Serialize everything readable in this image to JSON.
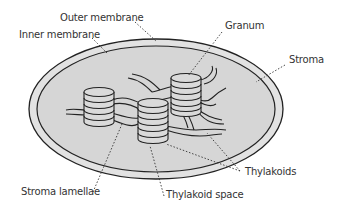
{
  "labels": {
    "outer_membrane": "Outer membrane",
    "inner_membrane": "Inner membrane",
    "granum": "Granum",
    "stroma": "Stroma",
    "thylakoids": "Thylakoids",
    "stroma_lamellae": "Stroma lamellae",
    "thylakoid_space": "Thylakoid space"
  },
  "colors": {
    "outer_band": "#e2e2e2",
    "stroma_fill": "#d6d6d6",
    "stroke": "#222222",
    "text": "#333333"
  }
}
